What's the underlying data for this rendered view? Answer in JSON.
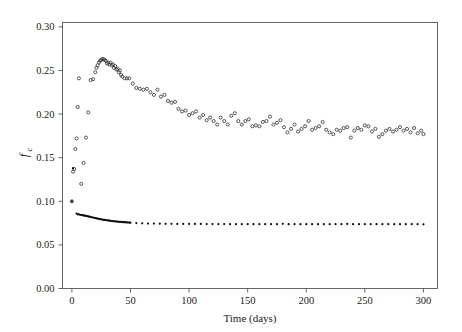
{
  "figure": {
    "background_color": "#ffffff",
    "frame_color": "#555555"
  },
  "axis": {
    "x_title": "Time (days)",
    "y_title_main": "f",
    "y_title_sub": "c",
    "x_ticks": [
      "0",
      "50",
      "100",
      "150",
      "200",
      "250",
      "300"
    ],
    "y_ticks": [
      "0.00",
      "0.05",
      "0.10",
      "0.15",
      "0.20",
      "0.25",
      "0.30"
    ]
  },
  "chart_data": {
    "type": "scatter",
    "title": "",
    "xlabel": "Time (days)",
    "ylabel": "fc",
    "xlim": [
      -8,
      312
    ],
    "ylim": [
      0.0,
      0.305
    ],
    "grid": false,
    "legend": "none",
    "x_tick_values": [
      0,
      50,
      100,
      150,
      200,
      250,
      300
    ],
    "y_tick_values": [
      0.0,
      0.05,
      0.1,
      0.15,
      0.2,
      0.25,
      0.3
    ],
    "marker_colors": {
      "open_circle_stroke": "#3b3b3b",
      "filled_circle_fill": "#0d0d0d"
    },
    "series": [
      {
        "name": "open-circles",
        "marker": "open-circle",
        "marker_size_px": 3.1,
        "points": [
          [
            0,
            0.1
          ],
          [
            1,
            0.134
          ],
          [
            2,
            0.137
          ],
          [
            3,
            0.16
          ],
          [
            4,
            0.172
          ],
          [
            5,
            0.208
          ],
          [
            6,
            0.241
          ],
          [
            8,
            0.12
          ],
          [
            10,
            0.144
          ],
          [
            12,
            0.173
          ],
          [
            14,
            0.202
          ],
          [
            16,
            0.239
          ],
          [
            18,
            0.24
          ],
          [
            20,
            0.248
          ],
          [
            21,
            0.253
          ],
          [
            22,
            0.256
          ],
          [
            23,
            0.259
          ],
          [
            24,
            0.261
          ],
          [
            25,
            0.262
          ],
          [
            26,
            0.263
          ],
          [
            27,
            0.263
          ],
          [
            28,
            0.262
          ],
          [
            29,
            0.261
          ],
          [
            30,
            0.258
          ],
          [
            31,
            0.259
          ],
          [
            32,
            0.257
          ],
          [
            33,
            0.259
          ],
          [
            34,
            0.256
          ],
          [
            35,
            0.257
          ],
          [
            36,
            0.253
          ],
          [
            37,
            0.255
          ],
          [
            38,
            0.251
          ],
          [
            39,
            0.252
          ],
          [
            40,
            0.248
          ],
          [
            41,
            0.25
          ],
          [
            42,
            0.245
          ],
          [
            43,
            0.243
          ],
          [
            45,
            0.241
          ],
          [
            47,
            0.241
          ],
          [
            49,
            0.241
          ],
          [
            52,
            0.235
          ],
          [
            55,
            0.23
          ],
          [
            58,
            0.229
          ],
          [
            61,
            0.228
          ],
          [
            64,
            0.229
          ],
          [
            67,
            0.225
          ],
          [
            70,
            0.222
          ],
          [
            73,
            0.228
          ],
          [
            76,
            0.22
          ],
          [
            79,
            0.222
          ],
          [
            82,
            0.215
          ],
          [
            85,
            0.213
          ],
          [
            88,
            0.214
          ],
          [
            91,
            0.206
          ],
          [
            94,
            0.203
          ],
          [
            97,
            0.204
          ],
          [
            100,
            0.199
          ],
          [
            103,
            0.201
          ],
          [
            106,
            0.203
          ],
          [
            109,
            0.196
          ],
          [
            112,
            0.199
          ],
          [
            115,
            0.193
          ],
          [
            118,
            0.196
          ],
          [
            121,
            0.192
          ],
          [
            124,
            0.188
          ],
          [
            127,
            0.196
          ],
          [
            130,
            0.192
          ],
          [
            133,
            0.188
          ],
          [
            136,
            0.198
          ],
          [
            139,
            0.201
          ],
          [
            142,
            0.192
          ],
          [
            145,
            0.188
          ],
          [
            148,
            0.192
          ],
          [
            151,
            0.194
          ],
          [
            154,
            0.186
          ],
          [
            157,
            0.187
          ],
          [
            160,
            0.186
          ],
          [
            163,
            0.191
          ],
          [
            166,
            0.192
          ],
          [
            169,
            0.197
          ],
          [
            172,
            0.188
          ],
          [
            175,
            0.19
          ],
          [
            178,
            0.193
          ],
          [
            181,
            0.185
          ],
          [
            184,
            0.179
          ],
          [
            187,
            0.183
          ],
          [
            190,
            0.188
          ],
          [
            193,
            0.18
          ],
          [
            196,
            0.183
          ],
          [
            199,
            0.186
          ],
          [
            202,
            0.192
          ],
          [
            205,
            0.182
          ],
          [
            208,
            0.184
          ],
          [
            211,
            0.186
          ],
          [
            214,
            0.191
          ],
          [
            217,
            0.182
          ],
          [
            220,
            0.179
          ],
          [
            223,
            0.177
          ],
          [
            226,
            0.182
          ],
          [
            229,
            0.181
          ],
          [
            232,
            0.184
          ],
          [
            235,
            0.185
          ],
          [
            238,
            0.173
          ],
          [
            241,
            0.181
          ],
          [
            244,
            0.184
          ],
          [
            247,
            0.182
          ],
          [
            250,
            0.187
          ],
          [
            253,
            0.186
          ],
          [
            256,
            0.18
          ],
          [
            259,
            0.183
          ],
          [
            262,
            0.174
          ],
          [
            265,
            0.177
          ],
          [
            268,
            0.181
          ],
          [
            271,
            0.183
          ],
          [
            274,
            0.18
          ],
          [
            277,
            0.182
          ],
          [
            280,
            0.185
          ],
          [
            283,
            0.181
          ],
          [
            286,
            0.183
          ],
          [
            289,
            0.179
          ],
          [
            292,
            0.184
          ],
          [
            295,
            0.178
          ],
          [
            298,
            0.181
          ],
          [
            300,
            0.177
          ]
        ]
      },
      {
        "name": "filled-circles",
        "marker": "filled-circle",
        "marker_size_px": 2.2,
        "points": [
          [
            0,
            0.1
          ],
          [
            1,
            0.138
          ],
          [
            4,
            0.086
          ],
          [
            5,
            0.085
          ],
          [
            6,
            0.085
          ],
          [
            7,
            0.0845
          ],
          [
            8,
            0.0843
          ],
          [
            9,
            0.0841
          ],
          [
            10,
            0.0838
          ],
          [
            11,
            0.0835
          ],
          [
            12,
            0.0832
          ],
          [
            13,
            0.0829
          ],
          [
            14,
            0.0826
          ],
          [
            15,
            0.0823
          ],
          [
            16,
            0.082
          ],
          [
            17,
            0.0817
          ],
          [
            18,
            0.0814
          ],
          [
            19,
            0.0811
          ],
          [
            20,
            0.0808
          ],
          [
            21,
            0.0805
          ],
          [
            22,
            0.0802
          ],
          [
            23,
            0.0799
          ],
          [
            24,
            0.0796
          ],
          [
            25,
            0.0793
          ],
          [
            26,
            0.079
          ],
          [
            27,
            0.0788
          ],
          [
            28,
            0.0786
          ],
          [
            29,
            0.0784
          ],
          [
            30,
            0.0782
          ],
          [
            31,
            0.078
          ],
          [
            32,
            0.0778
          ],
          [
            33,
            0.0776
          ],
          [
            34,
            0.0774
          ],
          [
            35,
            0.0772
          ],
          [
            36,
            0.0771
          ],
          [
            37,
            0.0769
          ],
          [
            38,
            0.0768
          ],
          [
            39,
            0.0767
          ],
          [
            40,
            0.0765
          ],
          [
            41,
            0.0764
          ],
          [
            42,
            0.0763
          ],
          [
            43,
            0.0762
          ],
          [
            44,
            0.0761
          ],
          [
            45,
            0.076
          ],
          [
            46,
            0.0759
          ],
          [
            47,
            0.0758
          ],
          [
            48,
            0.0757
          ],
          [
            49,
            0.0756
          ],
          [
            50,
            0.0755
          ],
          [
            55,
            0.075
          ],
          [
            60,
            0.0747
          ],
          [
            65,
            0.0745
          ],
          [
            70,
            0.0744
          ],
          [
            75,
            0.0743
          ],
          [
            80,
            0.0742
          ],
          [
            85,
            0.0742
          ],
          [
            90,
            0.0741
          ],
          [
            95,
            0.0741
          ],
          [
            100,
            0.074
          ],
          [
            105,
            0.074
          ],
          [
            110,
            0.074
          ],
          [
            115,
            0.0739
          ],
          [
            120,
            0.0739
          ],
          [
            125,
            0.0739
          ],
          [
            130,
            0.0739
          ],
          [
            135,
            0.0738
          ],
          [
            140,
            0.0738
          ],
          [
            145,
            0.0738
          ],
          [
            150,
            0.0738
          ],
          [
            155,
            0.0738
          ],
          [
            160,
            0.0738
          ],
          [
            165,
            0.0738
          ],
          [
            170,
            0.0738
          ],
          [
            175,
            0.0738
          ],
          [
            180,
            0.0742
          ],
          [
            185,
            0.0738
          ],
          [
            190,
            0.0737
          ],
          [
            195,
            0.0737
          ],
          [
            200,
            0.0737
          ],
          [
            205,
            0.0737
          ],
          [
            210,
            0.0737
          ],
          [
            215,
            0.0737
          ],
          [
            220,
            0.0737
          ],
          [
            225,
            0.0737
          ],
          [
            230,
            0.0737
          ],
          [
            235,
            0.0741
          ],
          [
            240,
            0.0737
          ],
          [
            245,
            0.0737
          ],
          [
            250,
            0.0737
          ],
          [
            255,
            0.0737
          ],
          [
            260,
            0.0737
          ],
          [
            265,
            0.0737
          ],
          [
            270,
            0.0737
          ],
          [
            275,
            0.0737
          ],
          [
            280,
            0.0737
          ],
          [
            285,
            0.0737
          ],
          [
            290,
            0.0737
          ],
          [
            295,
            0.0737
          ],
          [
            300,
            0.0736
          ]
        ]
      }
    ]
  }
}
